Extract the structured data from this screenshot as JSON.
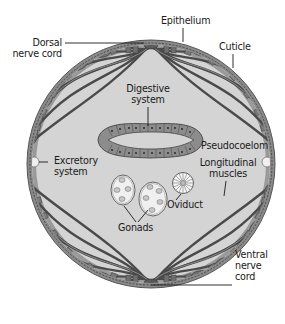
{
  "diagram": {
    "type": "cross-section",
    "colors": {
      "pseudocoelom_fill": "#d4d4d4",
      "cuticle": "#8a8a8a",
      "muscle": "#6e6e6e",
      "muscle_dark": "#4a4a4a",
      "gut_wall": "#8c8c8c",
      "text": "#1a1a1a"
    },
    "labels": {
      "dorsal_nerve_cord": [
        "Dorsal",
        "nerve cord"
      ],
      "epithelium": "Epithelium",
      "cuticle": "Cuticle",
      "digestive_system": [
        "Digestive",
        "system"
      ],
      "pseudocoelom": "Pseudocoelom",
      "excretory_system": [
        "Excretory",
        "system"
      ],
      "longitudinal_muscles": [
        "Longitudinal",
        "muscles"
      ],
      "oviduct": "Oviduct",
      "gonads": "Gonads",
      "ventral_nerve_cord": [
        "Ventral",
        "nerve",
        "cord"
      ]
    }
  }
}
